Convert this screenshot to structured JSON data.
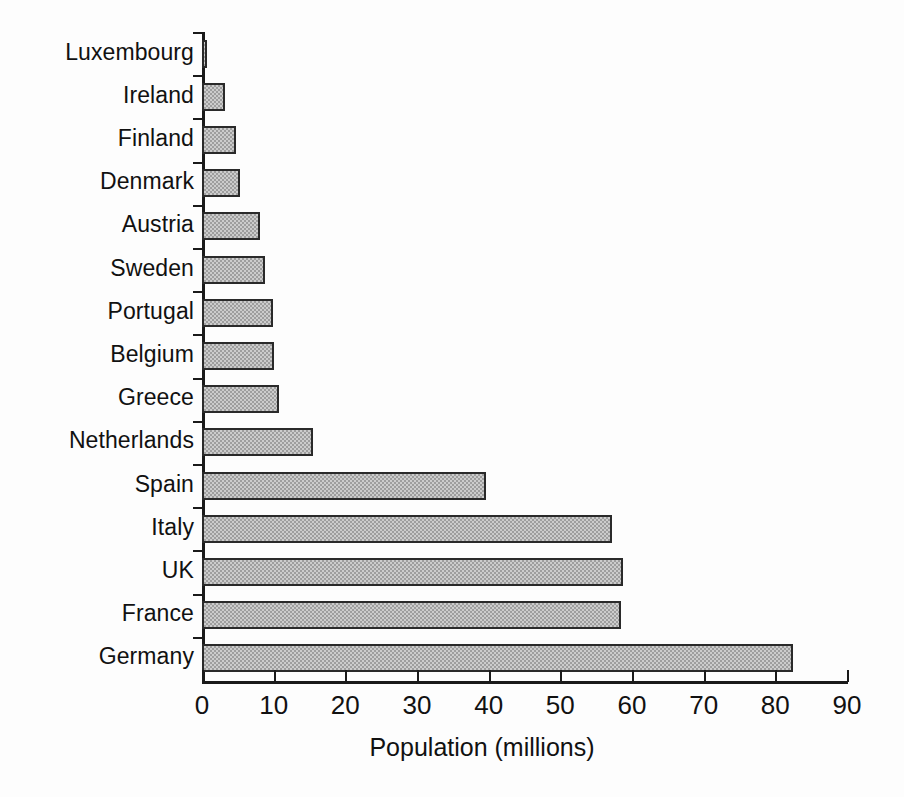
{
  "chart_data": {
    "type": "bar",
    "orientation": "horizontal",
    "title": "",
    "xlabel": "Population (millions)",
    "ylabel": "",
    "xlim": [
      0,
      90
    ],
    "xticks": [
      0,
      10,
      20,
      30,
      40,
      50,
      60,
      70,
      80,
      90
    ],
    "xtick_labels": [
      "0",
      "10",
      "20",
      "30",
      "40",
      "50",
      "60",
      "70",
      "80",
      "90"
    ],
    "grid": false,
    "legend": null,
    "bar_fill_color": "#cccccc",
    "bar_edge_color": "#2a2a2a",
    "background_color": "#ffffff",
    "categories": [
      "Luxembourg",
      "Ireland",
      "Finland",
      "Denmark",
      "Austria",
      "Sweden",
      "Portugal",
      "Belgium",
      "Greece",
      "Netherlands",
      "Spain",
      "Italy",
      "UK",
      "France",
      "Germany"
    ],
    "values": [
      0.4,
      3.2,
      4.7,
      5.3,
      8.1,
      8.8,
      9.9,
      10.1,
      10.8,
      15.5,
      39.6,
      57.2,
      58.7,
      58.5,
      82.4
    ]
  },
  "axis": {
    "x_title": "Population (millions)"
  }
}
